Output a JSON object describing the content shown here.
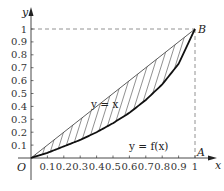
{
  "chart_data": {
    "type": "line",
    "title": "",
    "xlabel": "x",
    "ylabel": "y",
    "xlim": [
      0,
      1
    ],
    "ylim": [
      0,
      1
    ],
    "x_ticks": [
      "0.1",
      "0.2",
      "0.3",
      "0.4",
      "0.5",
      "0.6",
      "0.7",
      "0.8",
      "0.9",
      "1"
    ],
    "y_ticks": [
      "0.1",
      "0.2",
      "0.3",
      "0.4",
      "0.5",
      "0.6",
      "0.7",
      "0.8",
      "0.9",
      "1"
    ],
    "series": [
      {
        "name": "y = x",
        "x": [
          0,
          0.1,
          0.2,
          0.3,
          0.4,
          0.5,
          0.6,
          0.7,
          0.8,
          0.9,
          1
        ],
        "y": [
          0,
          0.1,
          0.2,
          0.3,
          0.4,
          0.5,
          0.6,
          0.7,
          0.8,
          0.9,
          1
        ]
      },
      {
        "name": "y = f(x)",
        "x": [
          0,
          0.1,
          0.2,
          0.3,
          0.4,
          0.5,
          0.6,
          0.7,
          0.8,
          0.9,
          1
        ],
        "y": [
          0,
          0.04,
          0.09,
          0.14,
          0.2,
          0.27,
          0.35,
          0.45,
          0.57,
          0.73,
          1
        ]
      }
    ],
    "shaded_region": "between y = x and y = f(x), hatched",
    "points": [
      {
        "label": "O",
        "x": 0,
        "y": 0
      },
      {
        "label": "A",
        "x": 1,
        "y": 0
      },
      {
        "label": "B",
        "x": 1,
        "y": 1
      }
    ],
    "guides": [
      "dashed line y=1 from x=0 to x=1",
      "dashed line x=1 from y=0 to y=1"
    ]
  },
  "labels": {
    "origin": "O",
    "point_a": "A",
    "point_b": "B",
    "x_axis": "x",
    "y_axis": "y",
    "line_label": "y = x",
    "curve_label": "y = f(x)"
  }
}
